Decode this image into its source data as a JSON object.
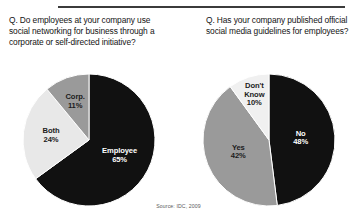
{
  "figure": {
    "source_note": "Source: IDC, 2009",
    "rule_color": "#3b3b3b"
  },
  "panels": [
    {
      "id": "left",
      "question": "Q. Do employees at your company use social networking for business through a corporate or self-directed initiative?"
    },
    {
      "id": "right",
      "question": "Q. Has your company published official social media guidelines for employees?"
    }
  ],
  "chart_data": [
    {
      "type": "pie",
      "title": "Q. Do employees at your company use social networking for business through a corporate or self-directed initiative?",
      "categories": [
        "Employee",
        "Both",
        "Corp."
      ],
      "values": [
        65,
        24,
        11
      ],
      "value_labels": [
        "65%",
        "24%",
        "11%"
      ],
      "colors": [
        "#111111",
        "#e8e8e8",
        "#9a9a9a"
      ],
      "label_colors": [
        "#ffffff",
        "#1c1c1c",
        "#1c1c1c"
      ],
      "start_angle_deg": 0,
      "direction": "clockwise",
      "units": "percent",
      "legend": "none",
      "labels_inside": true
    },
    {
      "type": "pie",
      "title": "Q. Has your company published official social media guidelines for employees?",
      "categories": [
        "No",
        "Yes",
        "Don't Know"
      ],
      "values": [
        48,
        42,
        10
      ],
      "value_labels": [
        "48%",
        "42%",
        "10%"
      ],
      "colors": [
        "#111111",
        "#9a9a9a",
        "#f0f0f0"
      ],
      "label_colors": [
        "#ffffff",
        "#1c1c1c",
        "#1c1c1c"
      ],
      "start_angle_deg": 0,
      "direction": "clockwise",
      "units": "percent",
      "legend": "none",
      "labels_inside": true
    }
  ]
}
